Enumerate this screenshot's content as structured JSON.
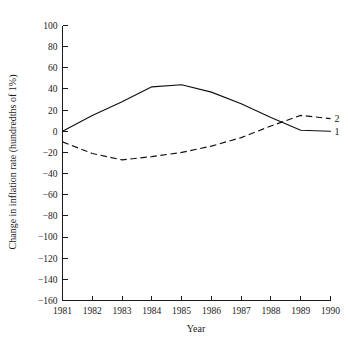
{
  "chart_data": {
    "type": "line",
    "title": "",
    "xlabel": "Year",
    "ylabel": "Change in inflation rate (hundredths of 1%)",
    "x": [
      1981,
      1982,
      1983,
      1984,
      1985,
      1986,
      1987,
      1988,
      1989,
      1990
    ],
    "xtick_labels": [
      "1981",
      "1982",
      "1983",
      "1984",
      "1985",
      "1986",
      "1987",
      "1988",
      "1989",
      "1990"
    ],
    "ytick_labels": [
      "100",
      "80",
      "60",
      "40",
      "20",
      "0",
      "−20",
      "−40",
      "−60",
      "−80",
      "−100",
      "−120",
      "−140",
      "−160"
    ],
    "ytick_values": [
      100,
      80,
      60,
      40,
      20,
      0,
      -20,
      -40,
      -60,
      -80,
      -100,
      -120,
      -140,
      -160
    ],
    "xlim": [
      1981,
      1990
    ],
    "ylim": [
      -160,
      100
    ],
    "grid": false,
    "legend_position": "line-end-labels",
    "series": [
      {
        "name": "1",
        "end_label": "1",
        "style": "solid",
        "color": "#101010",
        "values": [
          0,
          15,
          28,
          42,
          44,
          37,
          26,
          13,
          1,
          0
        ]
      },
      {
        "name": "2",
        "end_label": "2",
        "style": "dashed",
        "color": "#101010",
        "values": [
          -10,
          -21,
          -27,
          -24,
          -20,
          -14,
          -6,
          5,
          15,
          12
        ]
      }
    ]
  }
}
